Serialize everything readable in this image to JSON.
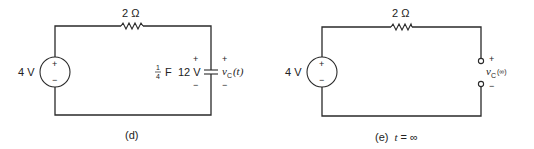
{
  "circuits": [
    {
      "id": "d",
      "caption": "(d)",
      "source": {
        "label": "4 V",
        "plus": "+",
        "minus": "−"
      },
      "resistor": {
        "label": "2 Ω"
      },
      "capacitor": {
        "value_num": "1",
        "value_den": "4",
        "value_unit": "F",
        "initial_voltage": "12 V",
        "plus": "+",
        "minus": "−"
      },
      "output": {
        "var": "v",
        "sub": "C",
        "arg": "(t)",
        "plus": "+",
        "minus": "−"
      }
    },
    {
      "id": "e",
      "caption_prefix": "(e)",
      "caption_var": "t",
      "caption_suffix": " = ∞",
      "source": {
        "label": "4 V",
        "plus": "+",
        "minus": "−"
      },
      "resistor": {
        "label": "2 Ω"
      },
      "output": {
        "var": "v",
        "sub": "C",
        "arg": "(∞)",
        "plus": "+",
        "minus": "−"
      }
    }
  ]
}
